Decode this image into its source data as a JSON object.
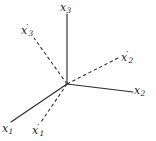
{
  "figure": {
    "background_color": "#fefefe",
    "stroke_color": "#2b2b2b",
    "label_color": "#242424",
    "width": 156,
    "height": 141
  },
  "origin": {
    "x": 67,
    "y": 84
  },
  "axes": [
    {
      "id": "x3",
      "label_base": "x",
      "label_sub": "3",
      "label_prime": "",
      "style": "solid",
      "from": {
        "x": 67,
        "y": 84
      },
      "to": {
        "x": 67,
        "y": 14
      },
      "label_pos": {
        "x": 60,
        "y": 2
      }
    },
    {
      "id": "x3p",
      "label_base": "x",
      "label_sub": "3",
      "label_prime": "′",
      "style": "dashed",
      "from": {
        "x": 67,
        "y": 84
      },
      "to": {
        "x": 34,
        "y": 38
      },
      "label_pos": {
        "x": 21,
        "y": 24
      }
    },
    {
      "id": "x2p",
      "label_base": "x",
      "label_sub": "2",
      "label_prime": "′",
      "style": "dashed",
      "from": {
        "x": 67,
        "y": 84
      },
      "to": {
        "x": 120,
        "y": 57
      },
      "label_pos": {
        "x": 121,
        "y": 51
      }
    },
    {
      "id": "x2",
      "label_base": "x",
      "label_sub": "2",
      "label_prime": "",
      "style": "solid",
      "from": {
        "x": 67,
        "y": 84
      },
      "to": {
        "x": 133,
        "y": 92
      },
      "label_pos": {
        "x": 134,
        "y": 85
      }
    },
    {
      "id": "x1",
      "label_base": "x",
      "label_sub": "1",
      "label_prime": "",
      "style": "solid",
      "from": {
        "x": 67,
        "y": 84
      },
      "to": {
        "x": 11,
        "y": 122
      },
      "label_pos": {
        "x": 2,
        "y": 123
      }
    },
    {
      "id": "x1p",
      "label_base": "x",
      "label_sub": "1",
      "label_prime": "′",
      "style": "dashed",
      "from": {
        "x": 67,
        "y": 84
      },
      "to": {
        "x": 41,
        "y": 122
      },
      "label_pos": {
        "x": 32,
        "y": 124
      }
    }
  ],
  "labels": {
    "x3": {
      "base": "x",
      "sub": "3",
      "prime": ""
    },
    "x3p": {
      "base": "x",
      "sub": "3",
      "prime": "′"
    },
    "x2p": {
      "base": "x",
      "sub": "2",
      "prime": "′"
    },
    "x2": {
      "base": "x",
      "sub": "2",
      "prime": ""
    },
    "x1": {
      "base": "x",
      "sub": "1",
      "prime": ""
    },
    "x1p": {
      "base": "x",
      "sub": "1",
      "prime": "′"
    }
  }
}
